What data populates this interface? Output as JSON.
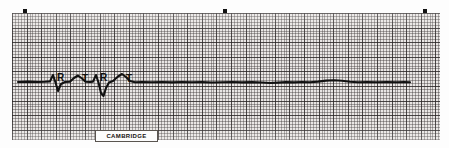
{
  "strip": {
    "kind": "ecg-rhythm-strip",
    "width": 449,
    "height": 148,
    "background_color": "#ffffff"
  },
  "paper": {
    "label": "ECG graph paper",
    "x": 12,
    "y": 13,
    "width": 428,
    "height": 127,
    "fill_color": "#e9e6e4",
    "fine_line_color": "#3c3737",
    "bold_line_color": "#282424",
    "fine_spacing_px": 2.92,
    "bold_spacing_px": 14.6
  },
  "timing_ticks": [
    {
      "name": "timing-tick-1",
      "x": 23
    },
    {
      "name": "timing-tick-2",
      "x": 223
    },
    {
      "name": "timing-tick-3",
      "x": 423
    }
  ],
  "trace": {
    "color": "#111111",
    "stroke_width": 2.1,
    "baseline_y": 69,
    "description": "Two sinus/escape QRS-T complexes followed by a long flat asystolic baseline",
    "path": "M 6 69 L 16 68.6 L 26 69 L 33 68.8 L 38 68.4 L 41 62 L 43.5 69.5 L 46 78 L 49 71 L 53 69 L 58 68.6 L 62 65 L 66 62.5 L 70 65.5 L 73.5 68.8 L 78 69 L 81 68.6 L 84 62 L 86.5 69.5 L 89 80 L 91.5 83 L 94 75 L 97 69.5 L 101 68 L 106 63.5 L 110 61 L 114 64 L 118 68 L 123 69.2 L 130 69 L 140 69.3 L 150 69 L 160 69.4 L 170 69 L 180 69.3 L 190 69.1 L 200 69.5 L 210 69.2 L 220 69 L 230 69.4 L 240 69.1 L 250 69.5 L 258 70 L 266 69.6 L 274 69.1 L 282 69.4 L 290 69 L 298 69.3 L 306 68.6 L 314 67.6 L 322 67.2 L 330 67.7 L 338 68.7 L 346 69.3 L 355 69 L 365 69.2 L 375 69 L 385 69.3 L 392 69 L 398 69.2"
  },
  "wave_labels": [
    {
      "name": "wave-label-r-1",
      "text": "R",
      "x": 45,
      "y": 60
    },
    {
      "name": "wave-label-t-1",
      "text": "T",
      "x": 70,
      "y": 61
    },
    {
      "name": "wave-label-r-2",
      "text": "R",
      "x": 88,
      "y": 60
    },
    {
      "name": "wave-label-t-2",
      "text": "T",
      "x": 114,
      "y": 61
    }
  ],
  "brand": {
    "text": "CAMBRIDGE"
  }
}
